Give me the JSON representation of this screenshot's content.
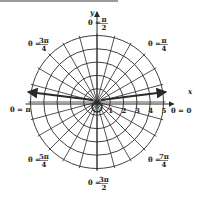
{
  "diagram": {
    "type": "polar-coordinate-grid",
    "center": {
      "x": 97,
      "y": 102
    },
    "unit_px": 13.3,
    "radii": [
      1,
      2,
      3,
      4,
      5
    ],
    "radial_step_deg": 15,
    "axes": {
      "x_label": "x",
      "y_label": "y"
    },
    "radius_ticks": [
      "1",
      "2",
      "3",
      "4",
      "5"
    ],
    "angle_labels": [
      {
        "id": "theta-0",
        "lhs": "θ = ",
        "num": "0",
        "den": ""
      },
      {
        "id": "theta-pi-4",
        "lhs": "θ = ",
        "num": "π",
        "den": "4"
      },
      {
        "id": "theta-pi-2",
        "lhs": "θ = ",
        "num": "π",
        "den": "2"
      },
      {
        "id": "theta-3pi-4",
        "lhs": "θ = ",
        "num": "3π",
        "den": "4"
      },
      {
        "id": "theta-pi",
        "lhs": "θ = ",
        "num": "π",
        "den": ""
      },
      {
        "id": "theta-5pi-4",
        "lhs": "θ = ",
        "num": "5π",
        "den": "4"
      },
      {
        "id": "theta-3pi-2",
        "lhs": "θ = ",
        "num": "3π",
        "den": "2"
      },
      {
        "id": "theta-7pi-4",
        "lhs": "θ = ",
        "num": "7π",
        "den": "4"
      }
    ],
    "colors": {
      "line": "#2a2a2a",
      "background": "#ffffff",
      "topbar": "#9a9a9a"
    }
  }
}
